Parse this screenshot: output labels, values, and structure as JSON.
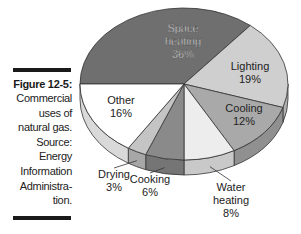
{
  "caption": {
    "title": "Figure 12-5:",
    "lines": [
      "Commercial",
      "uses of",
      "natural gas.",
      "Source:",
      "Energy",
      "Information",
      "Administra-",
      "tion."
    ]
  },
  "chart_data": {
    "type": "pie",
    "style": "3d-exploded-none",
    "title": "Commercial uses of natural gas",
    "source": "Energy Information Administration",
    "slices": [
      {
        "label": "Space heating",
        "value": 36,
        "value_label": "36%",
        "color": "#6f6f6f"
      },
      {
        "label": "Lighting",
        "value": 19,
        "value_label": "19%",
        "color": "#cfcfcf"
      },
      {
        "label": "Cooling",
        "value": 12,
        "value_label": "12%",
        "color": "#a9a9a9"
      },
      {
        "label": "Water heating",
        "value": 8,
        "value_label": "8%",
        "color": "#ededed"
      },
      {
        "label": "Cooking",
        "value": 6,
        "value_label": "6%",
        "color": "#8a8a8a"
      },
      {
        "label": "Drying",
        "value": 3,
        "value_label": "3%",
        "color": "#c4c4c4"
      },
      {
        "label": "Other",
        "value": 16,
        "value_label": "16%",
        "color": "#ffffff"
      }
    ],
    "start_angle_deg": 180,
    "direction": "clockwise",
    "legend": "none"
  }
}
